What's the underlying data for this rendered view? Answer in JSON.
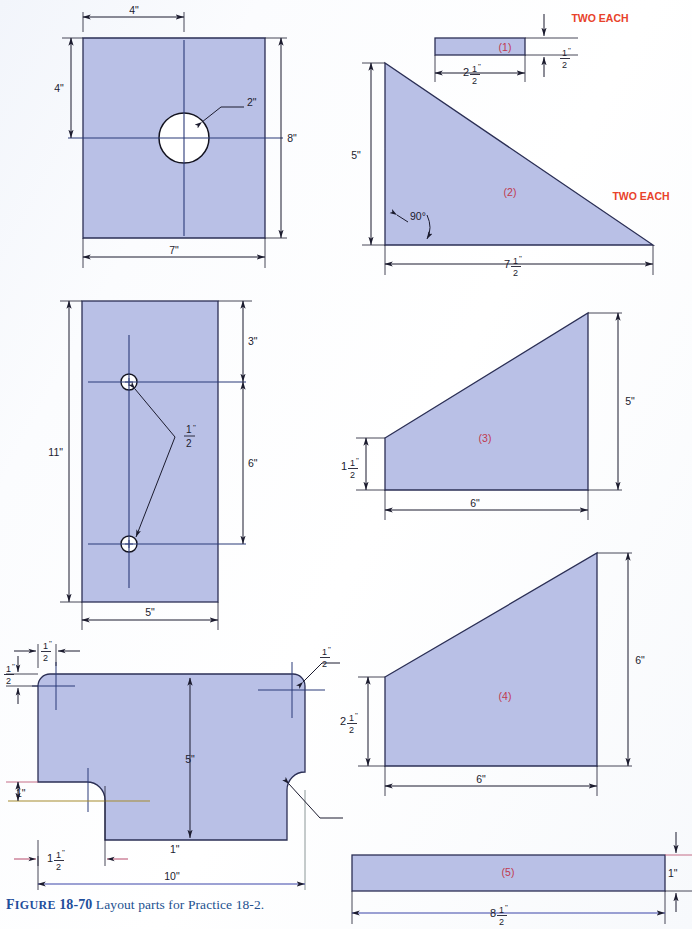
{
  "figure": {
    "caption_label": "FIGURE",
    "caption_label_first": "F",
    "caption_label_rest": "IGURE",
    "caption_number": "18-70",
    "caption_text": "Layout parts for Practice 18-2.",
    "caption_color": "#1f4e9c"
  },
  "style": {
    "part_fill": "#b9c0e6",
    "part_stroke": "#2b2f55",
    "dimension_line": "#1b1b2e",
    "note_color": "#e8422a",
    "part_label_color": "#c0394f",
    "center_line": "#2b3a78",
    "page_background": "#fdfdfd"
  },
  "parts": [
    {
      "id": "plate-with-hole",
      "label": "",
      "dimensions": {
        "top_offset": "4\"",
        "left_height": "4\"",
        "right_height": "8\"",
        "width": "7\"",
        "hole_diameter": "2\""
      }
    },
    {
      "id": "bar-1",
      "label": "(1)",
      "note": "TWO EACH",
      "dimensions": {
        "length_whole": "2",
        "length_frac_num": "1",
        "length_frac_den": "2",
        "length_unit": "\"",
        "thickness_frac_num": "1",
        "thickness_frac_den": "2",
        "thickness_unit": "\""
      }
    },
    {
      "id": "triangle-2",
      "label": "(2)",
      "note": "TWO EACH",
      "dimensions": {
        "height": "5\"",
        "angle": "90°",
        "base_whole": "7",
        "base_frac_num": "1",
        "base_frac_den": "2",
        "base_unit": "\""
      }
    },
    {
      "id": "plate-two-holes",
      "label": "",
      "dimensions": {
        "overall_height": "11\"",
        "top_to_hole": "3\"",
        "hole_to_hole": "6\"",
        "width": "5\"",
        "hole_dia_num": "1",
        "hole_dia_den": "2",
        "hole_dia_unit": "\""
      }
    },
    {
      "id": "trapezoid-3",
      "label": "(3)",
      "dimensions": {
        "right_height": "5\"",
        "left_whole": "1",
        "left_frac_num": "1",
        "left_frac_den": "2",
        "left_unit": "\"",
        "base": "6\""
      }
    },
    {
      "id": "trapezoid-4",
      "label": "(4)",
      "dimensions": {
        "right_height": "6\"",
        "left_whole": "2",
        "left_frac_num": "1",
        "left_frac_den": "2",
        "left_unit": "\"",
        "base": "6\""
      }
    },
    {
      "id": "notched-plate",
      "label": "",
      "dimensions": {
        "corner_rad_top_left_num": "1",
        "corner_rad_top_left_den": "2",
        "corner_rad_top_left_unit": "\"",
        "edge_offset_num": "1",
        "edge_offset_den": "2",
        "edge_offset_unit": "\"",
        "corner_rad_top_right_num": "1",
        "corner_rad_top_right_den": "2",
        "corner_rad_top_right_unit": "\"",
        "height": "5\"",
        "notch_depth": "1\"",
        "notch_offset_whole": "1",
        "notch_offset_num": "1",
        "notch_offset_den": "2",
        "notch_offset_unit": "\"",
        "notch_radius_right": "1\"",
        "width": "10\""
      }
    },
    {
      "id": "bar-5",
      "label": "(5)",
      "dimensions": {
        "thickness": "1\"",
        "length_whole": "8",
        "length_frac_num": "1",
        "length_frac_den": "2",
        "length_unit": "\""
      }
    }
  ],
  "notes": {
    "two_each_top": "TWO EACH",
    "two_each_mid": "TWO EACH"
  },
  "labels": {
    "p1": "(1)",
    "p2": "(2)",
    "p3": "(3)",
    "p4": "(4)",
    "p5": "(5)"
  },
  "texts": {
    "dim_4in_a": "4\"",
    "dim_4in_b": "4\"",
    "dim_8in": "8\"",
    "dim_7in": "7\"",
    "dim_2in": "2\"",
    "dim_5in_tri": "5\"",
    "dim_90deg": "90°",
    "dim_11in": "11\"",
    "dim_3in": "3\"",
    "dim_6in_plate": "6\"",
    "dim_5in_plate": "5\"",
    "dim_5in_p3": "5\"",
    "dim_6in_p3": "6\"",
    "dim_6in_p4": "6\"",
    "dim_6in_p4base": "6\"",
    "dim_5in_notched": "5\"",
    "dim_1in_notch": "1\"",
    "dim_1in_radius": "1\"",
    "dim_10in": "10\"",
    "dim_1in_p5": "1\""
  }
}
